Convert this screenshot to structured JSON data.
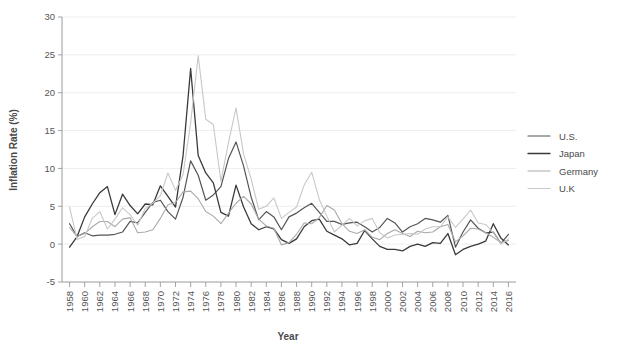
{
  "chart_data": {
    "type": "line",
    "title": "",
    "xlabel": "Year",
    "ylabel": "Inflation Rate (%)",
    "xlim": [
      1957,
      2017
    ],
    "ylim": [
      -5,
      30
    ],
    "yticks": [
      -5,
      0,
      5,
      10,
      15,
      20,
      25,
      30
    ],
    "ytick_labels": [
      "-5",
      "0",
      "5",
      "10",
      "15",
      "20",
      "25",
      "30"
    ],
    "grid": true,
    "grid_axis": "y",
    "legend_position": "right",
    "x": [
      1958,
      1959,
      1960,
      1961,
      1962,
      1963,
      1964,
      1965,
      1966,
      1967,
      1968,
      1969,
      1970,
      1971,
      1972,
      1973,
      1974,
      1975,
      1976,
      1977,
      1978,
      1979,
      1980,
      1981,
      1982,
      1983,
      1984,
      1985,
      1986,
      1987,
      1988,
      1989,
      1990,
      1991,
      1992,
      1993,
      1994,
      1995,
      1996,
      1997,
      1998,
      1999,
      2000,
      2001,
      2002,
      2003,
      2004,
      2005,
      2006,
      2007,
      2008,
      2009,
      2010,
      2011,
      2012,
      2013,
      2014,
      2015,
      2016
    ],
    "xticks": [
      1958,
      1960,
      1962,
      1964,
      1966,
      1968,
      1970,
      1972,
      1974,
      1976,
      1978,
      1980,
      1982,
      1984,
      1986,
      1988,
      1990,
      1992,
      1994,
      1996,
      1998,
      2000,
      2002,
      2004,
      2006,
      2008,
      2010,
      2012,
      2014,
      2016
    ],
    "xtick_labels": [
      "1958",
      "1960",
      "1962",
      "1964",
      "1966",
      "1968",
      "1970",
      "1972",
      "1974",
      "1976",
      "1978",
      "1980",
      "1982",
      "1984",
      "1986",
      "1988",
      "1990",
      "1992",
      "1994",
      "1996",
      "1998",
      "2000",
      "2002",
      "2004",
      "2006",
      "2008",
      "2010",
      "2012",
      "2014",
      "2016"
    ],
    "series": [
      {
        "name": "U.S.",
        "color": "#555555",
        "linewidth": 1.2,
        "values": [
          2.7,
          1.0,
          1.5,
          1.1,
          1.2,
          1.2,
          1.3,
          1.6,
          3.0,
          2.8,
          4.2,
          5.5,
          5.8,
          4.3,
          3.3,
          6.2,
          11.0,
          9.1,
          5.8,
          6.5,
          7.6,
          11.3,
          13.5,
          10.3,
          6.2,
          3.2,
          4.3,
          3.6,
          1.9,
          3.6,
          4.1,
          4.8,
          5.4,
          4.2,
          3.0,
          3.0,
          2.6,
          2.8,
          2.9,
          2.3,
          1.6,
          2.2,
          3.4,
          2.8,
          1.6,
          2.3,
          2.7,
          3.4,
          3.2,
          2.9,
          3.8,
          -0.4,
          1.6,
          3.2,
          2.1,
          1.5,
          1.6,
          0.1,
          1.3
        ]
      },
      {
        "name": "Japan",
        "color": "#3a3a3a",
        "linewidth": 1.3,
        "values": [
          -0.4,
          1.0,
          3.6,
          5.3,
          6.8,
          7.6,
          3.9,
          6.6,
          5.1,
          4.0,
          5.3,
          5.2,
          7.7,
          6.3,
          4.9,
          11.7,
          23.2,
          11.7,
          9.4,
          8.1,
          4.2,
          3.7,
          7.8,
          4.9,
          2.7,
          1.9,
          2.3,
          2.0,
          0.6,
          0.1,
          0.7,
          2.3,
          3.1,
          3.3,
          1.7,
          1.2,
          0.7,
          -0.1,
          0.1,
          1.8,
          0.7,
          -0.3,
          -0.7,
          -0.7,
          -0.9,
          -0.3,
          0.0,
          -0.3,
          0.2,
          0.1,
          1.4,
          -1.4,
          -0.7,
          -0.3,
          0.0,
          0.4,
          2.7,
          0.8,
          -0.1
        ]
      },
      {
        "name": "Germany",
        "color": "#aaaaaa",
        "linewidth": 1.1,
        "values": [
          2.2,
          1.0,
          1.4,
          2.3,
          3.0,
          3.0,
          2.3,
          3.3,
          3.5,
          1.5,
          1.6,
          1.9,
          3.4,
          5.2,
          5.5,
          6.9,
          7.0,
          6.0,
          4.3,
          3.7,
          2.7,
          4.1,
          5.4,
          6.3,
          5.3,
          3.3,
          2.4,
          2.1,
          -0.1,
          0.2,
          1.3,
          2.8,
          2.7,
          3.5,
          5.1,
          4.5,
          2.7,
          1.7,
          1.4,
          1.9,
          0.9,
          0.6,
          1.4,
          1.9,
          1.4,
          1.0,
          1.7,
          1.5,
          1.6,
          2.3,
          2.6,
          0.3,
          1.1,
          2.1,
          2.0,
          1.5,
          0.9,
          0.2,
          0.5
        ]
      },
      {
        "name": "U.K",
        "color": "#c8c8c8",
        "linewidth": 1.1,
        "values": [
          4.9,
          0.6,
          1.0,
          3.4,
          4.3,
          2.0,
          3.3,
          4.8,
          3.9,
          2.5,
          4.7,
          5.4,
          6.4,
          9.4,
          7.1,
          9.2,
          16.0,
          24.9,
          16.5,
          15.8,
          8.3,
          13.4,
          18.0,
          11.9,
          8.6,
          4.6,
          5.0,
          6.1,
          3.4,
          4.2,
          4.9,
          7.8,
          9.5,
          5.9,
          3.7,
          1.6,
          2.5,
          3.4,
          2.4,
          3.1,
          3.4,
          1.5,
          0.8,
          1.2,
          1.3,
          1.4,
          1.3,
          2.0,
          2.3,
          2.3,
          3.6,
          2.2,
          3.3,
          4.5,
          2.8,
          2.6,
          1.5,
          0.0,
          0.7
        ]
      }
    ]
  },
  "legend": {
    "entries": [
      {
        "label": "U.S.",
        "color": "#555555"
      },
      {
        "label": "Japan",
        "color": "#3a3a3a"
      },
      {
        "label": "Germany",
        "color": "#aaaaaa"
      },
      {
        "label": "U.K",
        "color": "#c8c8c8"
      }
    ]
  }
}
